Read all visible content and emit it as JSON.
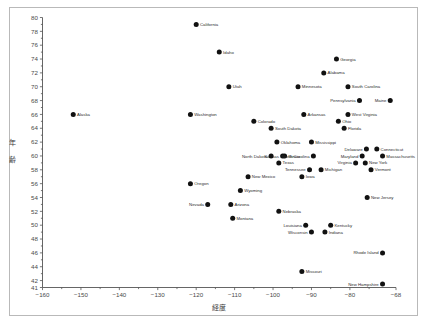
{
  "figure": {
    "background_color": "#ffffff",
    "border_color": "#b9b9b9",
    "marker_color": "#111111",
    "axis_color": "#555555",
    "label_color": "#2b2b2b"
  },
  "chart_data": {
    "type": "scatter",
    "title": "",
    "xlabel": "経度",
    "ylabel": "年齢",
    "xlim": [
      -160,
      -68
    ],
    "ylim": [
      41,
      80
    ],
    "grid": false,
    "legend": null,
    "xticks": [
      -160,
      -150,
      -140,
      -130,
      -120,
      -110,
      -100,
      -90,
      -80,
      -68
    ],
    "xtick_labels": [
      "−160",
      "−150",
      "−140",
      "−130",
      "−120",
      "−110",
      "−100",
      "−90",
      "−80",
      "−68"
    ],
    "yticks": [
      41,
      42,
      44,
      46,
      48,
      50,
      52,
      54,
      56,
      58,
      60,
      62,
      64,
      66,
      68,
      70,
      72,
      74,
      76,
      78,
      80
    ],
    "ytick_labels": [
      "41",
      "42",
      "44",
      "46",
      "48",
      "50",
      "52",
      "54",
      "56",
      "58",
      "60",
      "62",
      "64",
      "66",
      "68",
      "70",
      "72",
      "74",
      "76",
      "78",
      "80"
    ],
    "points": [
      {
        "label": "California",
        "x": -120.0,
        "y": 79,
        "side": "right"
      },
      {
        "label": "Idaho",
        "x": -114.0,
        "y": 75,
        "side": "right"
      },
      {
        "label": "Georgia",
        "x": -83.5,
        "y": 74,
        "side": "right"
      },
      {
        "label": "Alabama",
        "x": -86.8,
        "y": 72,
        "side": "right"
      },
      {
        "label": "Utah",
        "x": -111.5,
        "y": 70,
        "side": "right"
      },
      {
        "label": "Minnesota",
        "x": -93.5,
        "y": 70,
        "side": "right"
      },
      {
        "label": "South Carolina",
        "x": -80.5,
        "y": 70,
        "side": "right"
      },
      {
        "label": "Pennsylvania",
        "x": -77.5,
        "y": 68,
        "side": "left"
      },
      {
        "label": "Maine",
        "x": -69.5,
        "y": 68,
        "side": "left"
      },
      {
        "label": "Alaska",
        "x": -152.0,
        "y": 66,
        "side": "right"
      },
      {
        "label": "Washington",
        "x": -121.5,
        "y": 66,
        "side": "right"
      },
      {
        "label": "Arkansas",
        "x": -92.0,
        "y": 66,
        "side": "right"
      },
      {
        "label": "West Virginia",
        "x": -80.5,
        "y": 66,
        "side": "right"
      },
      {
        "label": "Colorado",
        "x": -105.0,
        "y": 65,
        "side": "right"
      },
      {
        "label": "Ohio",
        "x": -83.0,
        "y": 65,
        "side": "right"
      },
      {
        "label": "South Dakota",
        "x": -100.5,
        "y": 64,
        "side": "right"
      },
      {
        "label": "Florida",
        "x": -81.5,
        "y": 64,
        "side": "right"
      },
      {
        "label": "Oklahoma",
        "x": -99.0,
        "y": 62,
        "side": "right"
      },
      {
        "label": "Mississippi",
        "x": -90.0,
        "y": 62,
        "side": "right"
      },
      {
        "label": "Delaware",
        "x": -75.7,
        "y": 61,
        "side": "left"
      },
      {
        "label": "Connecticut",
        "x": -73.0,
        "y": 61,
        "side": "right"
      },
      {
        "label": "Kansas",
        "x": -97.5,
        "y": 60,
        "side": "left"
      },
      {
        "label": "Maryland",
        "x": -76.8,
        "y": 60,
        "side": "left"
      },
      {
        "label": "North Dakota",
        "x": -100.5,
        "y": 60,
        "side": "left"
      },
      {
        "label": "Illinois",
        "x": -97.0,
        "y": 60,
        "side": "right"
      },
      {
        "label": "North Carolina",
        "x": -89.5,
        "y": 60,
        "side": "left"
      },
      {
        "label": "Massachusetts",
        "x": -71.5,
        "y": 60,
        "side": "right"
      },
      {
        "label": "Texas",
        "x": -98.5,
        "y": 59,
        "side": "right"
      },
      {
        "label": "Virginia",
        "x": -78.5,
        "y": 59,
        "side": "left"
      },
      {
        "label": "New York",
        "x": -76.0,
        "y": 59,
        "side": "right"
      },
      {
        "label": "Tennessee",
        "x": -90.5,
        "y": 58,
        "side": "left"
      },
      {
        "label": "Michigan",
        "x": -87.5,
        "y": 58,
        "side": "right"
      },
      {
        "label": "Vermont",
        "x": -74.5,
        "y": 58,
        "side": "right"
      },
      {
        "label": "New Mexico",
        "x": -106.5,
        "y": 57,
        "side": "right"
      },
      {
        "label": "Iowa",
        "x": -92.5,
        "y": 57,
        "side": "right"
      },
      {
        "label": "Oregon",
        "x": -121.5,
        "y": 56,
        "side": "right"
      },
      {
        "label": "Wyoming",
        "x": -108.5,
        "y": 55,
        "side": "right"
      },
      {
        "label": "New Jersey",
        "x": -75.5,
        "y": 54,
        "side": "right"
      },
      {
        "label": "Nevada",
        "x": -117.0,
        "y": 53,
        "side": "left"
      },
      {
        "label": "Arizona",
        "x": -111.0,
        "y": 53,
        "side": "right"
      },
      {
        "label": "Nebraska",
        "x": -98.5,
        "y": 52,
        "side": "right"
      },
      {
        "label": "Montana",
        "x": -110.5,
        "y": 51,
        "side": "right"
      },
      {
        "label": "Louisiana",
        "x": -91.5,
        "y": 50,
        "side": "left"
      },
      {
        "label": "Kentucky",
        "x": -85.0,
        "y": 50,
        "side": "right"
      },
      {
        "label": "Wisconsin",
        "x": -90.0,
        "y": 49,
        "side": "left"
      },
      {
        "label": "Indiana",
        "x": -86.5,
        "y": 49,
        "side": "right"
      },
      {
        "label": "Rhode Island",
        "x": -71.5,
        "y": 46,
        "side": "left"
      },
      {
        "label": "Missouri",
        "x": -92.5,
        "y": 43.3,
        "side": "right"
      },
      {
        "label": "New Hampshire",
        "x": -71.5,
        "y": 41.5,
        "side": "left"
      }
    ]
  }
}
